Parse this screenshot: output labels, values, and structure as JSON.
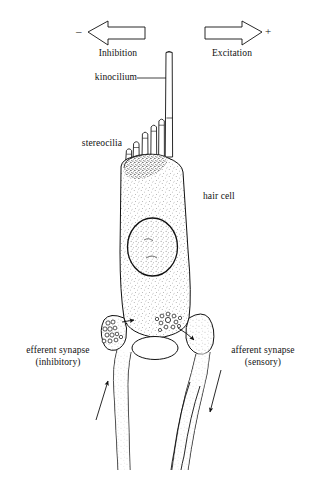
{
  "figure": {
    "background": "#ffffff",
    "ink": "#111111",
    "width": 317,
    "height": 478
  },
  "direction_cues": {
    "inhibition": {
      "label": "Inhibition",
      "sign": "–",
      "arrow_direction": "left",
      "meaning": "deflection away from kinocilium"
    },
    "excitation": {
      "label": "Excitation",
      "sign": "+",
      "arrow_direction": "right",
      "meaning": "deflection toward kinocilium"
    }
  },
  "labels": {
    "kinocilium": "kinocilium",
    "stereocilia": "stereocilia",
    "hair_cell": "hair cell",
    "efferent_line1": "efferent synapse",
    "efferent_line2": "(inhibitory)",
    "afferent_line1": "afferent synapse",
    "afferent_line2": "(sensory)"
  },
  "structures": {
    "kinocilium": {
      "name": "kinocilium",
      "count": 1,
      "position": "apical, right of stereocilia bundle",
      "height_px": 300
    },
    "stereocilia": {
      "name": "stereocilia",
      "count": 5,
      "arrangement": "graded staircase, tallest adjacent to kinocilium"
    },
    "cuticular_plate": {
      "name": "cuticular-plate",
      "shading": "dense stipple",
      "position": "apical pole of hair cell"
    },
    "nucleus": {
      "name": "nucleus",
      "shape": "ellipse",
      "position": "mid-cell"
    },
    "efferent_bouton": {
      "name": "efferent-bouton",
      "vesicles": "clustered synaptic vesicles",
      "arrow": "toward hair cell",
      "fiber_arrow_direction": "up"
    },
    "afferent_bouton": {
      "name": "afferent-bouton",
      "vesicles": "ribbon synapse, vesicle rosette",
      "arrow": "toward afferent terminal",
      "fiber_arrow_direction": "down"
    },
    "supporting_body": {
      "name": "basal-body-vesicle",
      "shape": "ellipse between the two terminals"
    },
    "nerve_fibers": {
      "efferent_fiber_count": 1,
      "afferent_fiber_count": 2
    }
  }
}
